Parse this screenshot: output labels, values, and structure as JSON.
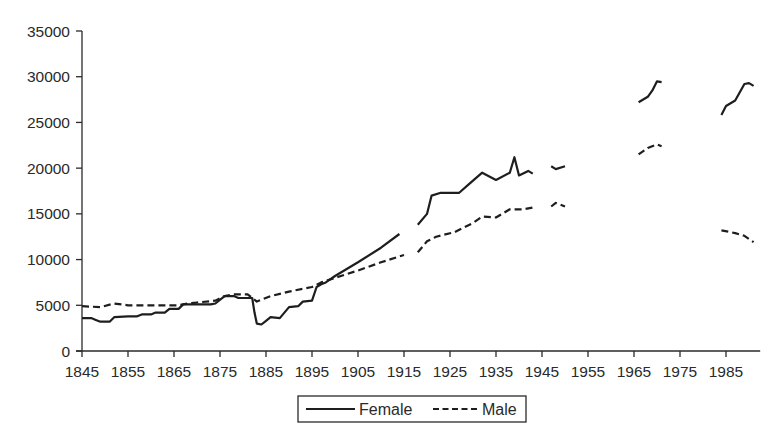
{
  "chart_data": {
    "type": "line",
    "title": "",
    "xlabel": "",
    "ylabel": "",
    "xlim": [
      1845,
      1992
    ],
    "ylim": [
      0,
      35000
    ],
    "grid": false,
    "legend_position": "bottom-center",
    "x_ticks": [
      1845,
      1855,
      1865,
      1875,
      1885,
      1895,
      1905,
      1915,
      1925,
      1935,
      1945,
      1955,
      1965,
      1975,
      1985
    ],
    "y_ticks": [
      0,
      5000,
      10000,
      15000,
      20000,
      25000,
      30000,
      35000
    ],
    "legend": [
      "Female",
      "Male"
    ],
    "series": [
      {
        "name": "Female",
        "style": "solid",
        "segments": [
          [
            [
              1845,
              3600
            ],
            [
              1847,
              3600
            ],
            [
              1848,
              3400
            ],
            [
              1849,
              3200
            ],
            [
              1851,
              3200
            ],
            [
              1852,
              3700
            ],
            [
              1855,
              3800
            ],
            [
              1857,
              3800
            ],
            [
              1858,
              4000
            ],
            [
              1860,
              4000
            ],
            [
              1861,
              4200
            ],
            [
              1863,
              4200
            ],
            [
              1864,
              4600
            ],
            [
              1866,
              4600
            ],
            [
              1867,
              5100
            ],
            [
              1871,
              5100
            ],
            [
              1873,
              5100
            ],
            [
              1874,
              5200
            ],
            [
              1876,
              6000
            ],
            [
              1878,
              6000
            ],
            [
              1879,
              5800
            ],
            [
              1882,
              5800
            ],
            [
              1882.5,
              4200
            ],
            [
              1883,
              3000
            ],
            [
              1884,
              2900
            ],
            [
              1885,
              3300
            ],
            [
              1886,
              3700
            ],
            [
              1888,
              3600
            ],
            [
              1889,
              4200
            ],
            [
              1890,
              4800
            ],
            [
              1892,
              4900
            ],
            [
              1893,
              5400
            ],
            [
              1895,
              5500
            ],
            [
              1896,
              7000
            ],
            [
              1897,
              7300
            ],
            [
              1898,
              7500
            ],
            [
              1900,
              8200
            ],
            [
              1905,
              9700
            ],
            [
              1910,
              11300
            ],
            [
              1914,
              12800
            ]
          ],
          [
            [
              1918,
              13800
            ],
            [
              1920,
              15000
            ],
            [
              1921,
              17000
            ],
            [
              1923,
              17300
            ],
            [
              1927,
              17300
            ],
            [
              1929,
              18200
            ],
            [
              1932,
              19500
            ],
            [
              1935,
              18700
            ],
            [
              1938,
              19500
            ],
            [
              1939,
              21200
            ],
            [
              1940,
              19200
            ],
            [
              1942,
              19700
            ],
            [
              1943,
              19400
            ]
          ],
          [
            [
              1947,
              20200
            ],
            [
              1948,
              19900
            ],
            [
              1950,
              20200
            ]
          ],
          [
            [
              1966,
              27200
            ],
            [
              1968,
              27800
            ],
            [
              1969,
              28500
            ],
            [
              1970,
              29500
            ],
            [
              1971,
              29400
            ]
          ],
          [
            [
              1984,
              25800
            ],
            [
              1985,
              26800
            ],
            [
              1987,
              27400
            ],
            [
              1989,
              29200
            ],
            [
              1990,
              29300
            ],
            [
              1991,
              29000
            ]
          ]
        ]
      },
      {
        "name": "Male",
        "style": "dashed",
        "segments": [
          [
            [
              1845,
              4900
            ],
            [
              1849,
              4800
            ],
            [
              1852,
              5200
            ],
            [
              1855,
              5000
            ],
            [
              1860,
              5000
            ],
            [
              1866,
              5000
            ],
            [
              1868,
              5200
            ],
            [
              1870,
              5300
            ],
            [
              1874,
              5500
            ],
            [
              1876,
              6000
            ],
            [
              1878,
              6200
            ],
            [
              1881,
              6200
            ],
            [
              1883,
              5400
            ],
            [
              1886,
              6000
            ],
            [
              1890,
              6500
            ],
            [
              1895,
              7000
            ],
            [
              1897,
              7500
            ],
            [
              1900,
              8000
            ],
            [
              1905,
              8800
            ],
            [
              1910,
              9700
            ],
            [
              1915,
              10500
            ]
          ],
          [
            [
              1918,
              10800
            ],
            [
              1920,
              12000
            ],
            [
              1922,
              12500
            ],
            [
              1926,
              13000
            ],
            [
              1930,
              14000
            ],
            [
              1932,
              14700
            ],
            [
              1935,
              14600
            ],
            [
              1938,
              15500
            ],
            [
              1941,
              15500
            ],
            [
              1943,
              15700
            ]
          ],
          [
            [
              1947,
              15800
            ],
            [
              1948,
              16200
            ],
            [
              1950,
              15800
            ]
          ],
          [
            [
              1966,
              21500
            ],
            [
              1968,
              22200
            ],
            [
              1970,
              22600
            ],
            [
              1971,
              22400
            ]
          ],
          [
            [
              1984,
              13200
            ],
            [
              1987,
              12900
            ],
            [
              1989,
              12600
            ],
            [
              1991,
              11900
            ]
          ]
        ]
      }
    ]
  }
}
